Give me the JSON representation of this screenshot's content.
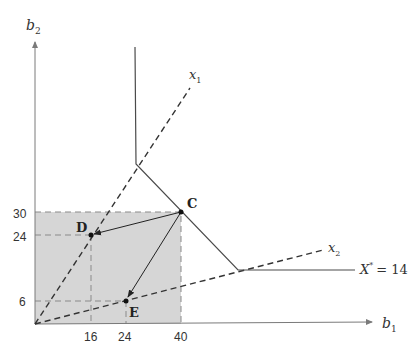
{
  "diagram": {
    "axes": {
      "x_label": "b",
      "x_sub": "1",
      "y_label": "b",
      "y_sub": "2"
    },
    "x_ticks": [
      "16",
      "24",
      "40"
    ],
    "y_ticks": [
      "30",
      "24",
      "6"
    ],
    "rays": [
      {
        "label": "x",
        "sub": "1"
      },
      {
        "label": "x",
        "sub": "2"
      }
    ],
    "isoquant": {
      "label": "X",
      "sup": "*",
      "value": "= 14"
    },
    "points": [
      {
        "name": "C",
        "b1": 40,
        "b2": 30
      },
      {
        "name": "D",
        "b1": 16,
        "b2": 24
      },
      {
        "name": "E",
        "b1": 24,
        "b2": 6
      }
    ],
    "colors": {
      "shade": "#d6d6d6",
      "line": "#4a4a4a",
      "axis": "#7a7a7a"
    }
  }
}
